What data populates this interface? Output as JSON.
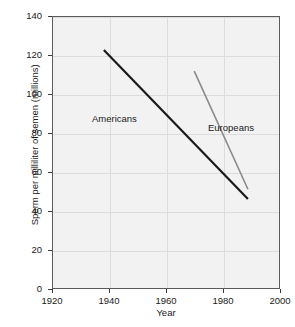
{
  "chart_data": {
    "type": "line",
    "title": "",
    "subtitle": "",
    "xlabel": "Year",
    "ylabel": "Sperm per milliliter of semen (millions)",
    "xlim": [
      1920,
      2000
    ],
    "ylim": [
      0,
      140
    ],
    "xticks": [
      1920,
      1940,
      1960,
      1980,
      2000
    ],
    "yticks": [
      0,
      20,
      40,
      60,
      80,
      100,
      120,
      140
    ],
    "xtick_labels": [
      "1920",
      "1940",
      "1960",
      "1980",
      "2000"
    ],
    "ytick_labels": [
      "0",
      "20",
      "40",
      "60",
      "80",
      "100",
      "120",
      "140"
    ],
    "grid": true,
    "grid_color": "#dcdcdc",
    "plot_background": "#f2f2f2",
    "frame_color": "#5b5b5b",
    "legend": "inline-annotations",
    "series": [
      {
        "name": "Americans",
        "color": "#1a1a1a",
        "line_width": 2.2,
        "x": [
          1938,
          1989
        ],
        "y": [
          123,
          46
        ],
        "annotation": {
          "text": "Americans",
          "x": 1953,
          "y": 90
        }
      },
      {
        "name": "Europeans",
        "color": "#8a8a8a",
        "line_width": 1.6,
        "x": [
          1970,
          1989
        ],
        "y": [
          112,
          51
        ],
        "annotation": {
          "text": "Europeans",
          "x": 1987,
          "y": 85
        }
      }
    ],
    "annotations": [
      {
        "text": "Americans",
        "series": "Americans"
      },
      {
        "text": "Europeans",
        "series": "Europeans"
      }
    ]
  },
  "axes": {
    "y_title": "Sperm per milliliter of semen (millions)",
    "x_title": "Year"
  }
}
